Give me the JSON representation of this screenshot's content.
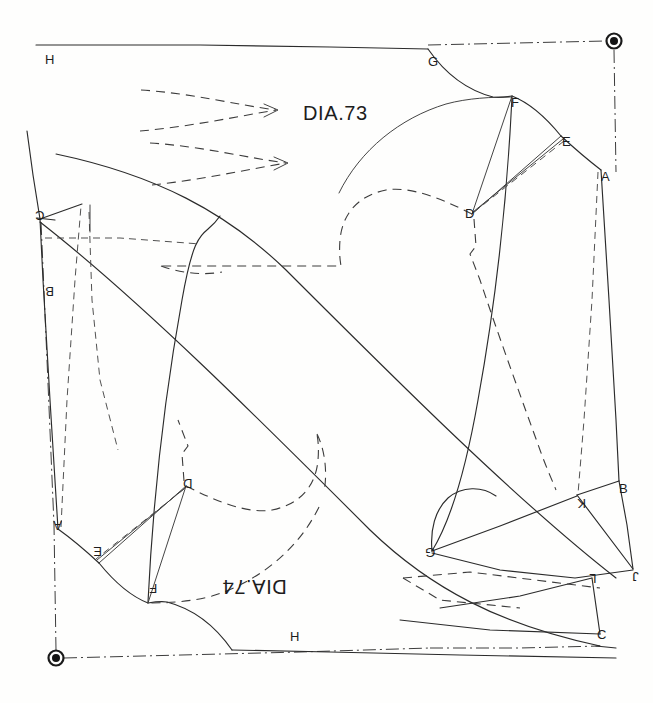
{
  "sheet": {
    "width": 653,
    "height": 703,
    "background": "#fefefd",
    "ink_color": "#2b2b2b"
  },
  "diagrams": [
    {
      "id": "dia-73",
      "title": "DIA.73",
      "orientation": "upright",
      "title_position": {
        "x": 303,
        "y": 103
      },
      "points": [
        {
          "label": "H",
          "x": 45,
          "y": 53,
          "role": "top-left-corner"
        },
        {
          "label": "G",
          "x": 428,
          "y": 55,
          "role": "neck-back"
        },
        {
          "label": "F",
          "x": 511,
          "y": 96,
          "role": "shoulder-dart-outer"
        },
        {
          "label": "E",
          "x": 562,
          "y": 135,
          "role": "shoulder-point"
        },
        {
          "label": "A",
          "x": 601,
          "y": 170,
          "role": "right-upper"
        },
        {
          "label": "D",
          "x": 472,
          "y": 213,
          "role": "dart-apex"
        },
        {
          "label": "B",
          "x": 619,
          "y": 482,
          "role": "right-lower"
        },
        {
          "label": "K",
          "x": 577,
          "y": 497,
          "role": "side-notch"
        },
        {
          "label": "J",
          "x": 632,
          "y": 570,
          "role": "side-lower"
        },
        {
          "label": "G",
          "x": 430,
          "y": 552,
          "role": "underarm"
        },
        {
          "label": "C",
          "x": 600,
          "y": 634,
          "role": "bottom-right"
        },
        {
          "label": "H",
          "x": 293,
          "y": 637,
          "role": "hem-center"
        }
      ]
    },
    {
      "id": "dia-74",
      "title": "DIA.74",
      "orientation": "rotated-180",
      "title_position": {
        "x": 222,
        "y": 577
      },
      "points": [
        {
          "label": "C",
          "x": 38,
          "y": 215,
          "role": "top-left-corner"
        },
        {
          "label": "B",
          "x": 48,
          "y": 290,
          "role": "left-upper"
        },
        {
          "label": "A",
          "x": 56,
          "y": 525,
          "role": "left-lower"
        },
        {
          "label": "E",
          "x": 96,
          "y": 551,
          "role": "shoulder-point"
        },
        {
          "label": "D",
          "x": 186,
          "y": 485,
          "role": "dart-apex"
        },
        {
          "label": "F",
          "x": 152,
          "y": 588,
          "role": "shoulder-dart-outer"
        },
        {
          "label": "L",
          "x": 592,
          "y": 578,
          "role": "side-lower"
        }
      ]
    }
  ],
  "pivots": [
    {
      "name": "pivot-top-right",
      "x": 614,
      "y": 41,
      "outer_r": 8,
      "inner_r": 4
    },
    {
      "name": "pivot-bottom-left",
      "x": 56,
      "y": 658,
      "outer_r": 8,
      "inner_r": 4
    }
  ],
  "line_styles": {
    "solid": "solid cutting line",
    "dashed": "dashed construction / underlying pattern line",
    "dash_dot": "dash-dot centre / pivot axis line"
  },
  "annotations": {
    "darts_count": 2,
    "dart_description": "two dashed pointed darts in upper-left field"
  }
}
